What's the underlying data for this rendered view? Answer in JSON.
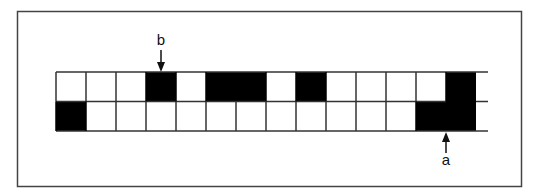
{
  "figure": {
    "colors": {
      "filled": "#000000",
      "empty": "#ffffff",
      "line": "#333333",
      "frame": "#444444"
    },
    "grid": {
      "columns": 14,
      "rows": [
        {
          "name": "top",
          "cells": [
            0,
            0,
            0,
            1,
            0,
            1,
            1,
            0,
            1,
            0,
            0,
            0,
            0,
            1
          ]
        },
        {
          "name": "bottom",
          "cells": [
            1,
            0,
            0,
            0,
            0,
            0,
            0,
            0,
            0,
            0,
            0,
            0,
            1,
            1
          ]
        }
      ],
      "open_right_end": true
    },
    "markers": [
      {
        "id": "b",
        "label": "b",
        "row": "top",
        "column": 3,
        "direction": "down"
      },
      {
        "id": "a",
        "label": "a",
        "row": "bottom",
        "column": 12.5,
        "direction": "up"
      }
    ]
  }
}
